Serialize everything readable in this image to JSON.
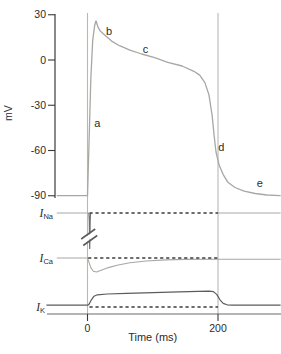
{
  "figure": {
    "colors": {
      "trace_light": "#a7a8a4",
      "refline": "#b8b9b5",
      "trace_dark": "#5c5c5c",
      "spike_dark": "#6e6e6e",
      "dashed": "#3d3d3d",
      "axis": "#3a3a3a",
      "axis_bottom": "#6a6b67",
      "text": "#2b2b2b",
      "background": "#ffffff"
    }
  },
  "chart_data": {
    "type": "line",
    "xlabel": "Time (ms)",
    "x_ticks": [
      {
        "label": "0",
        "value": 0
      },
      {
        "label": "200",
        "value": 200
      }
    ],
    "reference_lines_ms": [
      0,
      200
    ],
    "panels": [
      {
        "id": "vm",
        "ylabel": "mV",
        "ylim": [
          -90,
          30
        ],
        "y_ticks": [
          {
            "label": "30",
            "value": 30
          },
          {
            "label": "0",
            "value": 0
          },
          {
            "label": "-30",
            "value": -30
          },
          {
            "label": "-60",
            "value": -60
          },
          {
            "label": "-90",
            "value": -90
          }
        ],
        "series": [
          {
            "name": "membrane-potential",
            "points": [
              [
                -47,
                -90
              ],
              [
                0,
                -90
              ],
              [
                2,
                -60
              ],
              [
                5,
                -13
              ],
              [
                8,
                13
              ],
              [
                11,
                23
              ],
              [
                13,
                26
              ],
              [
                16,
                22
              ],
              [
                20,
                19
              ],
              [
                28,
                16
              ],
              [
                37,
                12.5
              ],
              [
                49,
                9.5
              ],
              [
                65,
                6.5
              ],
              [
                83,
                4
              ],
              [
                103,
                1.5
              ],
              [
                123,
                -1.5
              ],
              [
                145,
                -4
              ],
              [
                163,
                -7.5
              ],
              [
                172,
                -10
              ],
              [
                180,
                -15
              ],
              [
                186,
                -23
              ],
              [
                191,
                -36.5
              ],
              [
                194,
                -50
              ],
              [
                197,
                -61
              ],
              [
                202,
                -70
              ],
              [
                208,
                -76
              ],
              [
                215,
                -81
              ],
              [
                226,
                -84.5
              ],
              [
                240,
                -87
              ],
              [
                257,
                -88.5
              ],
              [
                275,
                -89.5
              ],
              [
                296,
                -90
              ]
            ]
          }
        ],
        "phase_labels": [
          {
            "text": "a",
            "t": 15,
            "v": -42
          },
          {
            "text": "b",
            "t": 33,
            "v": 19
          },
          {
            "text": "c",
            "t": 89,
            "v": 7
          },
          {
            "text": "d",
            "t": 205,
            "v": -58
          },
          {
            "text": "e",
            "t": 264,
            "v": -82
          }
        ]
      },
      {
        "id": "ina",
        "label": {
          "main": "I",
          "sub": "Na"
        },
        "units": "arbitrary (spike truncated by axis break)",
        "zero_dash_ms": [
          3,
          200
        ],
        "axis_break": true,
        "segments": [
          {
            "tone": "light",
            "points": [
              [
                -47,
                0
              ],
              [
                2.2,
                0
              ]
            ]
          },
          {
            "tone": "spike",
            "points": [
              [
                2.2,
                0
              ],
              [
                2.8,
                -0.6
              ],
              [
                3.4,
                -2.95
              ],
              [
                4.2,
                -0.5
              ],
              [
                4.8,
                0
              ]
            ]
          },
          {
            "tone": "light",
            "points": [
              [
                200,
                0
              ],
              [
                296,
                0
              ]
            ]
          }
        ]
      },
      {
        "id": "ica",
        "label": {
          "main": "I",
          "sub": "Ca"
        },
        "units": "arbitrary",
        "zero_dash_ms": [
          1,
          200
        ],
        "axis_break": false,
        "segments": [
          {
            "tone": "light",
            "points": [
              [
                -47,
                0
              ],
              [
                0,
                0
              ],
              [
                2,
                -0.3
              ],
              [
                5,
                -0.8
              ],
              [
                9,
                -1.1
              ],
              [
                14,
                -1.17
              ],
              [
                22,
                -1.0
              ],
              [
                32,
                -0.8
              ],
              [
                47,
                -0.58
              ],
              [
                65,
                -0.4
              ],
              [
                90,
                -0.25
              ],
              [
                120,
                -0.16
              ],
              [
                150,
                -0.12
              ],
              [
                200,
                -0.1
              ],
              [
                296,
                -0.1
              ]
            ]
          }
        ]
      },
      {
        "id": "ik",
        "label": {
          "main": "I",
          "sub": "K"
        },
        "units": "arbitrary",
        "zero_dash_ms": [
          3,
          200
        ],
        "axis_break": false,
        "segments": [
          {
            "tone": "dark",
            "points": [
              [
                -63,
                0.15
              ],
              [
                0,
                0.15
              ],
              [
                2,
                0.2
              ],
              [
                6,
                0.6
              ],
              [
                10,
                0.9
              ],
              [
                15,
                1.02
              ],
              [
                30,
                1.08
              ],
              [
                60,
                1.13
              ],
              [
                100,
                1.2
              ],
              [
                140,
                1.27
              ],
              [
                170,
                1.3
              ],
              [
                186,
                1.32
              ],
              [
                193,
                1.28
              ],
              [
                198,
                1.05
              ],
              [
                203,
                0.6
              ],
              [
                208,
                0.3
              ],
              [
                214,
                0.18
              ],
              [
                222,
                0.15
              ],
              [
                296,
                0.15
              ]
            ]
          }
        ]
      }
    ]
  }
}
